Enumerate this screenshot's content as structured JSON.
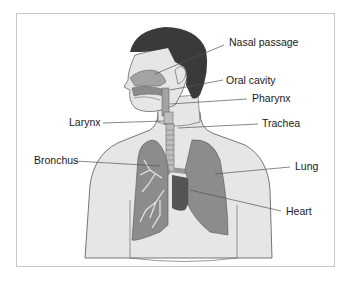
{
  "figure": {
    "labels": {
      "nasal_passage": "Nasal passage",
      "oral_cavity": "Oral cavity",
      "pharynx": "Pharynx",
      "larynx": "Larynx",
      "trachea": "Trachea",
      "bronchus": "Bronchus",
      "lung": "Lung",
      "heart": "Heart"
    },
    "colors": {
      "hair": "#3a3a3a",
      "skin": "#e6e6e6",
      "outline": "#555555",
      "airway": "#a3a3a3",
      "lung": "#8c8c8c",
      "heart": "#555555",
      "frame_border": "#c8c8c8"
    }
  }
}
